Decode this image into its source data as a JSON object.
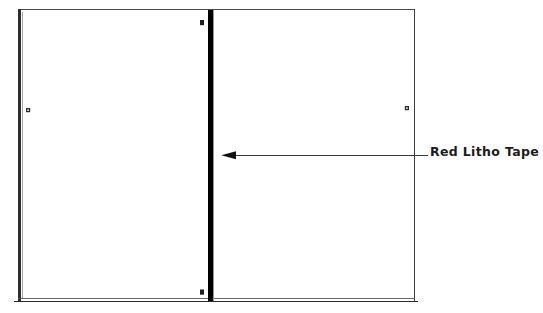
{
  "diagram": {
    "type": "technical-illustration",
    "background_color": "#ffffff",
    "ink_color": "#1b1b1b",
    "frame": {
      "name": "sheet-outline",
      "x": 18,
      "y": 9,
      "width": 397,
      "height": 293,
      "stroke_color": "#3a3a3a",
      "left_edge_weight": 2.6,
      "top_edge_weight": 1.1,
      "right_edge_weight": 1.4,
      "bottom_edge_weight": 1.3,
      "bottom_is_doubled_rule": true,
      "bottom_rule_gap": 3
    },
    "tape": {
      "name": "red-litho-tape-strip",
      "label": "Red Litho Tape",
      "color": "#000000",
      "x": 208,
      "y": 10,
      "width": 5,
      "height": 291,
      "orientation": "vertical"
    },
    "registration_marks": [
      {
        "name": "mark-tape-top",
        "x": 200,
        "y": 20,
        "width": 4,
        "height": 5
      },
      {
        "name": "mark-tape-bottom",
        "x": 200,
        "y": 290,
        "width": 4,
        "height": 5
      },
      {
        "name": "mark-left-panel",
        "x": 26,
        "y": 108,
        "width": 4,
        "height": 4
      },
      {
        "name": "mark-right-panel",
        "x": 405,
        "y": 106,
        "width": 4,
        "height": 4
      }
    ],
    "callout": {
      "name": "tape-callout",
      "label": "Red Litho Tape",
      "leader_line": {
        "from_x": 428,
        "to_x": 222,
        "y": 155,
        "stroke_width": 1.1
      },
      "arrowhead": {
        "direction": "left",
        "tip_x": 221,
        "length": 14,
        "half_height": 4.2
      }
    }
  }
}
